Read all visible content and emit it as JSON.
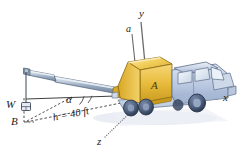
{
  "figure": {
    "background_color": "#ffffff"
  },
  "axes": {
    "y_label": "y",
    "x_label": "x",
    "z_label": "z"
  },
  "annotations": {
    "acceleration_label": "a",
    "angle_label": "α",
    "point_A_label": "A",
    "point_B_label": "B",
    "weight_label": "W",
    "boom_length_label": "h = 40 ft"
  },
  "colors": {
    "crane_body_light": "#f7d87a",
    "crane_body_mid": "#e8b938",
    "crane_body_dark": "#c99a1e",
    "crane_outline": "#8a6a10",
    "boom_light": "#dfe6ef",
    "boom_mid": "#9fb0c4",
    "boom_dark": "#6f8199",
    "boom_outline": "#5a6b80",
    "truck_body_light": "#e3e9f4",
    "truck_body_mid": "#b8c6de",
    "truck_body_dark": "#8fa2c0",
    "truck_outline": "#5c6d88",
    "glass": "#dde7f2",
    "wheel": "#4d5f7d",
    "wheel_dark": "#2e3c52",
    "line": "#2a2a2a",
    "dashed": "#333333",
    "shadow": "#dfe3ea"
  },
  "parts": {
    "boom": "telescoping-crane-boom",
    "weight_block": "suspended-weight-block",
    "cab": "truck-cab",
    "wheels_count": 4
  }
}
